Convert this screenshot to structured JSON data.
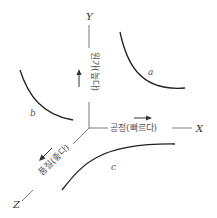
{
  "diagram": {
    "axes": {
      "x": {
        "letter": "X",
        "label": "공정(빠르다)"
      },
      "y": {
        "letter": "Y",
        "label": "원가(높다)"
      },
      "z": {
        "letter": "Z",
        "label": "품질(좋다)"
      }
    },
    "curves": [
      {
        "id": "a",
        "label": "a"
      },
      {
        "id": "b",
        "label": "b"
      },
      {
        "id": "c",
        "label": "c"
      }
    ],
    "colors": {
      "line": "#333333",
      "text": "#555555",
      "background": "#ffffff"
    }
  }
}
